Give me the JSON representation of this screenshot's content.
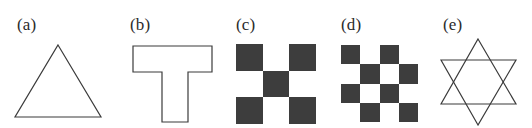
{
  "figure": {
    "background_color": "#ffffff",
    "stroke_color": "#3b3b3b",
    "dark_fill": "#3d3d3d",
    "light_fill": "#ffffff",
    "width": 532,
    "height": 128
  },
  "panels": [
    {
      "label": "(a)",
      "shape_name": "triangle",
      "label_x": 17,
      "label_y": 16,
      "geometry": {
        "x": 10,
        "y": 40,
        "w": 100,
        "h": 85,
        "points": "48,5 91,77 5,77"
      }
    },
    {
      "label": "(b)",
      "shape_name": "t-shape",
      "label_x": 130,
      "label_y": 16,
      "geometry": {
        "x": 128,
        "y": 40,
        "w": 95,
        "h": 88,
        "points": "5,6 84,6 84,32 60,32 60,82 34,82 34,32 5,32"
      }
    },
    {
      "label": "(c)",
      "shape_name": "checkerboard-3x3",
      "label_x": 236,
      "label_y": 16,
      "board": {
        "x": 236,
        "y": 44,
        "w": 80,
        "h": 80,
        "cols": 3,
        "rows": 3,
        "cells": [
          "dark",
          "light",
          "dark",
          "light",
          "dark",
          "light",
          "dark",
          "light",
          "dark"
        ]
      }
    },
    {
      "label": "(d)",
      "shape_name": "checkerboard-4x4",
      "label_x": 341,
      "label_y": 16,
      "board": {
        "x": 341,
        "y": 45,
        "w": 77,
        "h": 77,
        "cols": 4,
        "rows": 4,
        "cells": [
          "dark",
          "light",
          "dark",
          "light",
          "light",
          "dark",
          "light",
          "dark",
          "dark",
          "light",
          "dark",
          "light",
          "light",
          "dark",
          "light",
          "dark"
        ]
      }
    },
    {
      "label": "(e)",
      "shape_name": "star-of-david",
      "label_x": 443,
      "label_y": 16,
      "geometry": {
        "x": 440,
        "y": 34,
        "w": 88,
        "h": 94,
        "triangle_up": "38,5 76,70 1,70",
        "triangle_down": "38,91 1,26 76,26"
      }
    }
  ]
}
